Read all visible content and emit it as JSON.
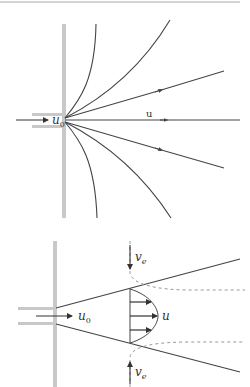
{
  "figure": {
    "top_panel": {
      "description": "Wall jet spreading radially from nozzle with streamlines",
      "labels": {
        "inlet_velocity": "u",
        "inlet_velocity_sub": "0",
        "downstream_velocity": "u"
      }
    },
    "bottom_panel": {
      "description": "Jet issuing from nozzle with spreading boundaries, velocity profile and entrainment",
      "labels": {
        "inlet_velocity": "u",
        "inlet_velocity_sub": "0",
        "profile_velocity": "u",
        "entrainment_top": "v",
        "entrainment_top_sub": "e",
        "entrainment_bottom": "v",
        "entrainment_bottom_sub": "e"
      }
    },
    "colors": {
      "wall": "#c8c8c8",
      "lines": "#444444",
      "dashed": "#999999",
      "top_rule": "#aaaaaa"
    }
  }
}
